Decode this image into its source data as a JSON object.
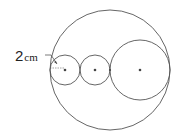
{
  "diagram": {
    "label": {
      "value": "2",
      "unit": "cm"
    },
    "circles": [
      {
        "name": "outer",
        "cx": 110,
        "cy": 70,
        "r": 60
      },
      {
        "name": "small-left",
        "cx": 65,
        "cy": 70,
        "r": 15
      },
      {
        "name": "small-middle",
        "cx": 95,
        "cy": 70,
        "r": 15
      },
      {
        "name": "large-right",
        "cx": 140,
        "cy": 70,
        "r": 30
      }
    ],
    "stroke_color": "#555555"
  }
}
